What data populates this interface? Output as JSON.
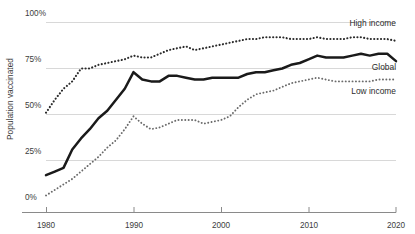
{
  "chart_data": {
    "type": "line",
    "title": "",
    "xlabel": "",
    "ylabel": "Population vaccinated",
    "xlim": [
      1980,
      2020
    ],
    "ylim": [
      0,
      100
    ],
    "grid": true,
    "legend_position": "right-inline",
    "y_ticks": [
      "0%",
      "25%",
      "50%",
      "75%",
      "100%"
    ],
    "y_tick_values": [
      0,
      25,
      50,
      75,
      100
    ],
    "x_ticks": [
      "1980",
      "1990",
      "2000",
      "2010",
      "2020"
    ],
    "x_tick_values": [
      1980,
      1990,
      2000,
      2010,
      2020
    ],
    "x": [
      1980,
      1981,
      1982,
      1983,
      1984,
      1985,
      1986,
      1987,
      1988,
      1989,
      1990,
      1991,
      1992,
      1993,
      1994,
      1995,
      1996,
      1997,
      1998,
      1999,
      2000,
      2001,
      2002,
      2003,
      2004,
      2005,
      2006,
      2007,
      2008,
      2009,
      2010,
      2011,
      2012,
      2013,
      2014,
      2015,
      2016,
      2017,
      2018,
      2019,
      2020
    ],
    "series": [
      {
        "name": "High income",
        "style": "dotted",
        "color": "#2b2b2b",
        "label_y_percent": 100,
        "values": [
          51,
          58,
          64,
          68,
          75,
          75,
          77,
          78,
          79,
          80,
          82,
          81,
          81,
          83,
          85,
          86,
          87,
          85,
          86,
          87,
          88,
          89,
          90,
          91,
          91,
          92,
          92,
          92,
          91,
          91,
          91,
          92,
          91,
          91,
          91,
          92,
          92,
          91,
          91,
          91,
          90
        ]
      },
      {
        "name": "Global",
        "style": "solid",
        "color": "#1a1a1a",
        "label_y_percent": 76,
        "values": [
          17,
          19,
          21,
          31,
          37,
          42,
          48,
          52,
          58,
          64,
          73,
          69,
          68,
          68,
          71,
          71,
          70,
          69,
          69,
          70,
          70,
          70,
          70,
          72,
          73,
          73,
          74,
          75,
          77,
          78,
          80,
          82,
          81,
          81,
          81,
          82,
          83,
          82,
          83,
          83,
          79
        ]
      },
      {
        "name": "Low income",
        "style": "dotted",
        "color": "#6b6b6b",
        "label_y_percent": 63,
        "values": [
          6,
          9,
          12,
          15,
          19,
          23,
          27,
          32,
          36,
          42,
          49,
          45,
          42,
          43,
          45,
          47,
          47,
          47,
          45,
          46,
          47,
          49,
          54,
          58,
          61,
          62,
          63,
          65,
          67,
          68,
          69,
          70,
          69,
          68,
          68,
          68,
          68,
          68,
          69,
          69,
          69
        ]
      }
    ]
  },
  "axis": {
    "y_title": "Population vaccinated"
  },
  "series_labels": {
    "high_income": "High income",
    "global": "Global",
    "low_income": "Low income"
  },
  "y_tick_labels": {
    "t0": "0%",
    "t25": "25%",
    "t50": "50%",
    "t75": "75%",
    "t100": "100%"
  },
  "x_tick_labels": {
    "t1980": "1980",
    "t1990": "1990",
    "t2000": "2000",
    "t2010": "2010",
    "t2020": "2020"
  },
  "colors": {
    "background": "#ffffff",
    "grid": "#d8d8d8",
    "axis": "#8a8a8a",
    "global_line": "#1a1a1a",
    "high_income_line": "#2b2b2b",
    "low_income_line": "#6b6b6b",
    "text": "#3c3c3c"
  }
}
